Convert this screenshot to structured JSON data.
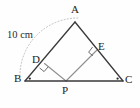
{
  "figure": {
    "kind": "geometry-diagram",
    "background_color": "#fefefe",
    "stroke_color": "#3a3a3a",
    "inner_stroke_color": "#8a8a8a",
    "arc_color": "#b0b0b0",
    "text_color": "#1c1c1c"
  },
  "labels": {
    "a": "A",
    "b": "B",
    "c": "C",
    "d": "D",
    "e": "E",
    "p": "P",
    "measure": "10 cm"
  },
  "points": {
    "A": {
      "x": 75,
      "y": 22
    },
    "B": {
      "x": 25,
      "y": 81
    },
    "C": {
      "x": 123,
      "y": 81
    },
    "P": {
      "x": 66,
      "y": 81
    },
    "D": {
      "x": 44.5,
      "y": 63.5
    },
    "E": {
      "x": 96.5,
      "y": 50.5
    }
  },
  "segments": [
    {
      "name": "side-AB",
      "from": "A",
      "to": "B",
      "style": "solid-dark"
    },
    {
      "name": "side-AC",
      "from": "A",
      "to": "C",
      "style": "solid-dark"
    },
    {
      "name": "side-BC",
      "from": "B",
      "to": "C",
      "style": "solid-dark"
    },
    {
      "name": "perpendicular-PD",
      "from": "P",
      "to": "D",
      "style": "solid-light"
    },
    {
      "name": "perpendicular-PE",
      "from": "P",
      "to": "E",
      "style": "solid-light"
    }
  ],
  "marks": {
    "right_angle_at_D": true,
    "right_angle_at_E": true,
    "vertex_dot_at_B": true,
    "vertex_dot_at_C": true,
    "dotted_arc_from_B_to_A": true
  }
}
